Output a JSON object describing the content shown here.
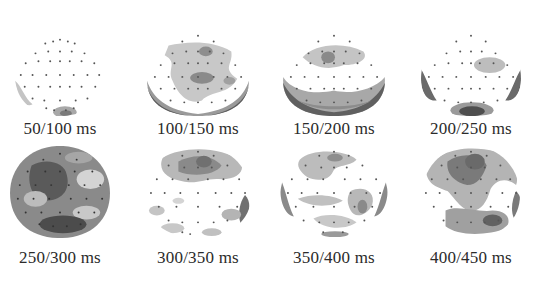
{
  "figure": {
    "rows": [
      {
        "maps": [
          {
            "label": "50/100 ms"
          },
          {
            "label": "100/150 ms"
          },
          {
            "label": "150/200 ms"
          },
          {
            "label": "200/250 ms"
          }
        ]
      },
      {
        "maps": [
          {
            "label": "250/300 ms"
          },
          {
            "label": "300/350 ms"
          },
          {
            "label": "350/400 ms"
          },
          {
            "label": "400/450 ms"
          }
        ]
      }
    ],
    "colors": {
      "background": "#ffffff",
      "light_activity": "#c8c8c8",
      "mid_activity": "#9a9a9a",
      "strong_activity": "#5a5a5a",
      "electrode_dot": "#555555",
      "label_text": "#2b2b2b"
    }
  }
}
